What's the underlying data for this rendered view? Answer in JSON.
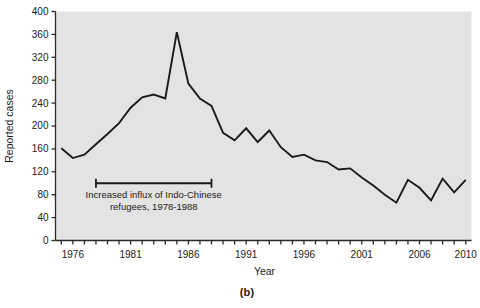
{
  "figure": {
    "caption": "(b)",
    "panel_background": "#ffffff",
    "plot_background": "#e3e3e3",
    "line_color": "#1a1a1a",
    "axis_color": "#2b2b2b",
    "text_color": "#1b1b1b"
  },
  "chart_data": {
    "type": "line",
    "title": "",
    "xlabel": "Year",
    "ylabel": "Reported cases",
    "xlim": [
      1974.5,
      2010.5
    ],
    "ylim": [
      0,
      400
    ],
    "grid": false,
    "legend": null,
    "y_ticks": [
      0,
      40,
      80,
      120,
      160,
      200,
      240,
      280,
      320,
      360,
      400
    ],
    "y_tick_labels": [
      "0",
      "40",
      "80",
      "120",
      "160",
      "200",
      "240",
      "280",
      "320",
      "360",
      "400"
    ],
    "x_ticks": [
      1975,
      1976,
      1977,
      1978,
      1979,
      1980,
      1981,
      1982,
      1983,
      1984,
      1985,
      1986,
      1987,
      1988,
      1989,
      1990,
      1991,
      1992,
      1993,
      1994,
      1995,
      1996,
      1997,
      1998,
      1999,
      2000,
      2001,
      2002,
      2003,
      2004,
      2005,
      2006,
      2007,
      2008,
      2009,
      2010
    ],
    "x_tick_labels": [
      "1976",
      "1981",
      "1986",
      "1991",
      "1996",
      "2001",
      "2006",
      "2010"
    ],
    "x_labeled_ticks": [
      1976,
      1981,
      1986,
      1991,
      1996,
      2001,
      2006,
      2010
    ],
    "x": [
      1975,
      1976,
      1977,
      1978,
      1979,
      1980,
      1981,
      1982,
      1983,
      1984,
      1985,
      1986,
      1987,
      1988,
      1989,
      1990,
      1991,
      1992,
      1993,
      1994,
      1995,
      1996,
      1997,
      1998,
      1999,
      2000,
      2001,
      2002,
      2003,
      2004,
      2005,
      2006,
      2007,
      2008,
      2009,
      2010
    ],
    "values": [
      161,
      144,
      150,
      168,
      186,
      205,
      232,
      250,
      255,
      248,
      364,
      274,
      248,
      235,
      188,
      175,
      196,
      172,
      192,
      163,
      146,
      150,
      140,
      137,
      124,
      126,
      110,
      96,
      80,
      66,
      106,
      92,
      70,
      108,
      84,
      106
    ],
    "annotations": [
      {
        "type": "span-bracket",
        "x_start": 1978,
        "x_end": 1988,
        "y": 100,
        "text_line_1": "Increased influx of Indo-Chinese",
        "text_line_2": "refugees, 1978-1988"
      }
    ]
  }
}
